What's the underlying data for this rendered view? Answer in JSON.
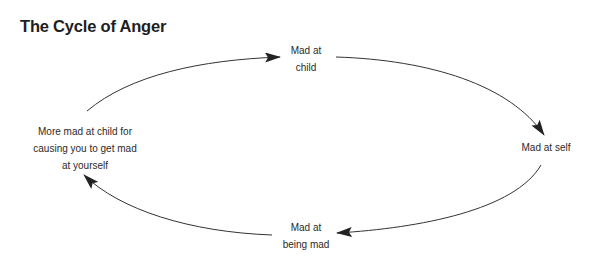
{
  "title": "The Cycle of Anger",
  "nodes": {
    "child": {
      "lines": [
        "Mad at",
        "child"
      ]
    },
    "self": {
      "lines": [
        "Mad at self"
      ]
    },
    "being_mad": {
      "lines": [
        "Mad at",
        "being mad"
      ]
    },
    "more_mad": {
      "lines": [
        "More mad at child for",
        "causing you to get mad",
        "at yourself"
      ]
    }
  },
  "edges": [
    {
      "from": "more_mad",
      "to": "child"
    },
    {
      "from": "child",
      "to": "self"
    },
    {
      "from": "self",
      "to": "being_mad"
    },
    {
      "from": "being_mad",
      "to": "more_mad"
    }
  ],
  "colors": {
    "line": "#333333",
    "text": "#2a2a2a",
    "title": "#1e1e1e"
  }
}
